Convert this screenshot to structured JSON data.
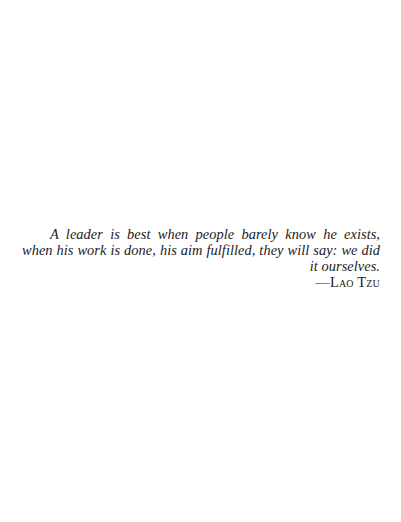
{
  "epigraph": {
    "quote": "A leader is best when people barely know he exists, when his work is done, his aim fulfilled, they will say: we did it ourselves.",
    "attribution": "—Lao Tzu"
  }
}
